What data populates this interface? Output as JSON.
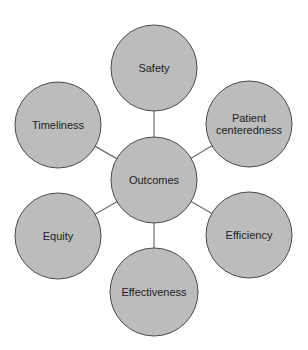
{
  "diagram": {
    "type": "hub-and-spoke",
    "colors": {
      "fill": "#bcbcbc",
      "stroke": "#4a4a4a",
      "connector": "#6e6e6e",
      "text": "#222222",
      "background": "#ffffff"
    },
    "hub": {
      "id": "outcomes",
      "label": "Outcomes",
      "cx": 154,
      "cy": 180,
      "r": 43
    },
    "nodes": [
      {
        "id": "safety",
        "lines": [
          "Safety"
        ],
        "cx": 154,
        "cy": 68,
        "r": 43
      },
      {
        "id": "patient-centeredness",
        "lines": [
          "Patient",
          "centeredness"
        ],
        "cx": 249,
        "cy": 124,
        "r": 43
      },
      {
        "id": "efficiency",
        "lines": [
          "Efficiency"
        ],
        "cx": 249,
        "cy": 235,
        "r": 43
      },
      {
        "id": "effectiveness",
        "lines": [
          "Effectiveness"
        ],
        "cx": 154,
        "cy": 292,
        "r": 44
      },
      {
        "id": "equity",
        "lines": [
          "Equity"
        ],
        "cx": 58,
        "cy": 236,
        "r": 43
      },
      {
        "id": "timeliness",
        "lines": [
          "Timeliness"
        ],
        "cx": 58,
        "cy": 125,
        "r": 43
      }
    ]
  }
}
